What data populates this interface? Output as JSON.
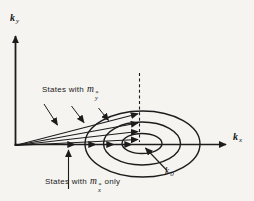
{
  "figure": {
    "description": "k-space diagram with constant-energy ellipses centered at k0 on the kx axis",
    "background_color": "#f5f4f1",
    "ink_color": "#1c1c1c"
  },
  "axes": {
    "y_label": {
      "symbol": "k",
      "sub": "y"
    },
    "x_label": {
      "symbol": "k",
      "sub": "x"
    }
  },
  "annotations": {
    "states_y": {
      "prefix": "States with",
      "symbol": "m",
      "sup": "*",
      "sub": "y"
    },
    "states_x": {
      "prefix": "States with",
      "symbol": "m",
      "sup": "*",
      "sub": "x",
      "suffix": "only"
    },
    "k0": {
      "symbol": "k",
      "sub": "0"
    }
  }
}
